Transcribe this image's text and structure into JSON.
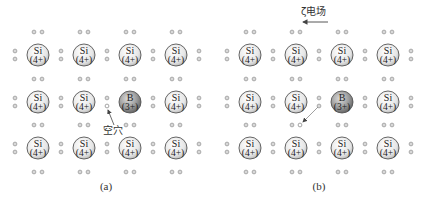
{
  "panels": [
    {
      "id": "a",
      "caption": "(a)",
      "caption_pos": [
        106,
        190
      ],
      "col_x": [
        38,
        84,
        130,
        176
      ],
      "row_y": [
        55,
        102,
        148
      ],
      "atoms": [
        [
          {
            "symbol": "Si",
            "charge": "(4+)"
          },
          {
            "symbol": "Si",
            "charge": "(4+)"
          },
          {
            "symbol": "Si",
            "charge": "(4+)"
          },
          {
            "symbol": "Si",
            "charge": "(4+)"
          }
        ],
        [
          {
            "symbol": "Si",
            "charge": "(4+)"
          },
          {
            "symbol": "Si",
            "charge": "(4+)"
          },
          {
            "symbol": "B",
            "charge": "(3+)"
          },
          {
            "symbol": "Si",
            "charge": "(4+)"
          }
        ],
        [
          {
            "symbol": "Si",
            "charge": "(4+)"
          },
          {
            "symbol": "Si",
            "charge": "(4+)"
          },
          {
            "symbol": "Si",
            "charge": "(4+)"
          },
          {
            "symbol": "Si",
            "charge": "(4+)"
          }
        ]
      ],
      "hole": {
        "x": 107,
        "y": 106
      },
      "hole_label": {
        "text": "空穴",
        "x": 103,
        "y": 134
      },
      "hole_arrow": {
        "x1": 114,
        "y1": 125,
        "x2": 108,
        "y2": 110
      }
    },
    {
      "id": "b",
      "caption": "(b)",
      "caption_pos": [
        319,
        190
      ],
      "col_x": [
        250,
        296,
        342,
        388
      ],
      "row_y": [
        55,
        102,
        148
      ],
      "atoms": [
        [
          {
            "symbol": "Si",
            "charge": "(4+)"
          },
          {
            "symbol": "Si",
            "charge": "(4+)"
          },
          {
            "symbol": "Si",
            "charge": "(4+)"
          },
          {
            "symbol": "Si",
            "charge": "(4+)"
          }
        ],
        [
          {
            "symbol": "Si",
            "charge": "(4+)"
          },
          {
            "symbol": "Si",
            "charge": "(4+)"
          },
          {
            "symbol": "B",
            "charge": "(3+)"
          },
          {
            "symbol": "Si",
            "charge": "(4+)"
          }
        ],
        [
          {
            "symbol": "Si",
            "charge": "(4+)"
          },
          {
            "symbol": "Si",
            "charge": "(4+)"
          },
          {
            "symbol": "Si",
            "charge": "(4+)"
          },
          {
            "symbol": "Si",
            "charge": "(4+)"
          }
        ]
      ],
      "hole": {
        "x": 301,
        "y": 125
      },
      "move_arrow": {
        "x1": 318,
        "y1": 107,
        "x2": 303,
        "y2": 122
      },
      "field_label": {
        "text": "ζ电场",
        "x": 301,
        "y": 15
      },
      "field_arrow": {
        "x1": 328,
        "y1": 22,
        "x2": 303,
        "y2": 22
      }
    }
  ],
  "colors": {
    "electron": "#9a9a9a",
    "atom_outline": "#555555",
    "si_fill_light": "#ffffff",
    "si_fill_dark": "#bdbdbd",
    "b_fill_light": "#d6d6d6",
    "b_fill_dark": "#6e6e6e",
    "text": "#333333",
    "arrow": "#444444"
  }
}
